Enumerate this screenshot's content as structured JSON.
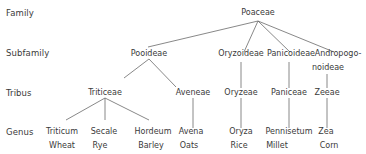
{
  "diagram": {
    "type": "taxonomy-tree",
    "rank_labels": [
      "Family",
      "Subfamily",
      "Tribus",
      "Genus"
    ],
    "family": {
      "name": "Poaceae"
    },
    "subfamilies": [
      {
        "name": "Pooideae"
      },
      {
        "name": "Oryzoideae"
      },
      {
        "name": "Panicoideae"
      },
      {
        "name_line1": "Andropogo-",
        "name_line2": "noideae"
      }
    ],
    "tribes": [
      {
        "name": "Triticeae",
        "parent": "Pooideae"
      },
      {
        "name": "Aveneae",
        "parent": "Pooideae"
      },
      {
        "name": "Oryzeae",
        "parent": "Oryzoideae"
      },
      {
        "name": "Paniceae",
        "parent": "Panicoideae"
      },
      {
        "name": "Zeeae",
        "parent": "Andropogonoideae"
      }
    ],
    "genera": [
      {
        "name": "Triticum",
        "common": "Wheat",
        "parent": "Triticeae"
      },
      {
        "name": "Secale",
        "common": "Rye",
        "parent": "Triticeae"
      },
      {
        "name": "Hordeum",
        "common": "Barley",
        "parent": "Triticeae"
      },
      {
        "name": "Avena",
        "common": "Oats",
        "parent": "Aveneae"
      },
      {
        "name": "Oryza",
        "common": "Rice",
        "parent": "Oryzeae"
      },
      {
        "name": "Pennisetum",
        "common": "Millet",
        "parent": "Paniceae"
      },
      {
        "name": "Zea",
        "common": "Corn",
        "parent": "Zeeae"
      }
    ]
  },
  "colors": {
    "text": "#3a3a3a",
    "lines": "#6a6a6a",
    "background": "#ffffff"
  }
}
